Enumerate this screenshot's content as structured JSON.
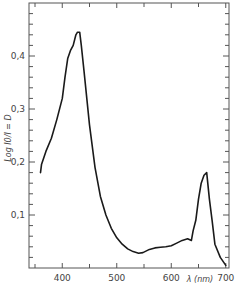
{
  "chart_data": {
    "type": "line",
    "title": "",
    "xlabel": "λ (nm)",
    "ylabel": "Log I0/I = D",
    "xlim": [
      350,
      700
    ],
    "ylim": [
      0,
      0.5
    ],
    "x_ticks": [
      400,
      500,
      600,
      700
    ],
    "x_tick_labels": [
      "400",
      "500",
      "600",
      "700"
    ],
    "y_ticks": [
      0.1,
      0.2,
      0.3,
      0.4
    ],
    "y_tick_labels": [
      "0,1",
      "0,2",
      "0,3",
      "0,4"
    ],
    "grid": false,
    "legend": null,
    "series": [
      {
        "name": "absorbance",
        "color": "#1a1a1a",
        "x": [
          360,
          362,
          370,
          380,
          390,
          400,
          405,
          410,
          415,
          420,
          425,
          428,
          432,
          435,
          440,
          450,
          460,
          470,
          480,
          490,
          500,
          510,
          520,
          530,
          540,
          548,
          560,
          570,
          580,
          590,
          600,
          610,
          620,
          630,
          637,
          640,
          645,
          650,
          655,
          660,
          665,
          670,
          675,
          680,
          690,
          700
        ],
        "y": [
          0.18,
          0.195,
          0.22,
          0.245,
          0.28,
          0.32,
          0.36,
          0.395,
          0.41,
          0.42,
          0.44,
          0.445,
          0.445,
          0.42,
          0.37,
          0.27,
          0.19,
          0.135,
          0.1,
          0.075,
          0.057,
          0.045,
          0.036,
          0.031,
          0.028,
          0.029,
          0.035,
          0.038,
          0.039,
          0.04,
          0.042,
          0.047,
          0.052,
          0.055,
          0.052,
          0.07,
          0.09,
          0.13,
          0.16,
          0.175,
          0.18,
          0.13,
          0.09,
          0.045,
          0.02,
          0.005
        ]
      }
    ]
  }
}
